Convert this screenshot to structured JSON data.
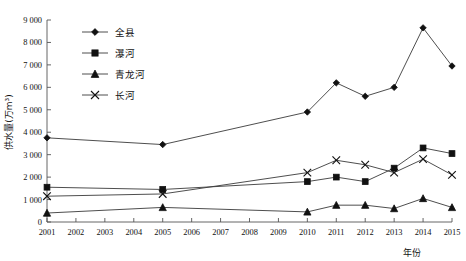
{
  "chart_data": {
    "type": "line",
    "title": "",
    "xlabel": "年份",
    "ylabel": "供水量(万m³)",
    "x": [
      2001,
      2005,
      2010,
      2011,
      2012,
      2013,
      2014,
      2015
    ],
    "categories": [
      "2001",
      "2002",
      "2003",
      "2004",
      "2005",
      "2006",
      "2007",
      "2008",
      "2009",
      "2010",
      "2011",
      "2012",
      "2013",
      "2014",
      "2015"
    ],
    "xlim": [
      2001,
      2015
    ],
    "ylim": [
      0,
      9000
    ],
    "yticks": [
      0,
      1000,
      2000,
      3000,
      4000,
      5000,
      6000,
      7000,
      8000,
      9000
    ],
    "ytick_labels": [
      "0",
      "1 000",
      "2 000",
      "3 000",
      "4 000",
      "5 000",
      "6 000",
      "7 000",
      "8 000",
      "9 000"
    ],
    "grid": false,
    "legend_position": "upper-left",
    "series": [
      {
        "name": "全县",
        "marker": "diamond",
        "x": [
          2001,
          2005,
          2010,
          2011,
          2012,
          2013,
          2014,
          2015
        ],
        "values": [
          3750,
          3450,
          4900,
          6200,
          5600,
          6000,
          8650,
          6950
        ]
      },
      {
        "name": "瀑河",
        "marker": "square",
        "x": [
          2001,
          2005,
          2010,
          2011,
          2012,
          2013,
          2014,
          2015
        ],
        "values": [
          1550,
          1450,
          1800,
          2000,
          1800,
          2400,
          3300,
          3050
        ]
      },
      {
        "name": "青龙河",
        "marker": "triangle",
        "x": [
          2001,
          2005,
          2010,
          2011,
          2012,
          2013,
          2014,
          2015
        ],
        "values": [
          400,
          650,
          450,
          750,
          750,
          600,
          1050,
          650
        ]
      },
      {
        "name": "长河",
        "marker": "cross",
        "x": [
          2001,
          2005,
          2010,
          2011,
          2012,
          2013,
          2014,
          2015
        ],
        "values": [
          1150,
          1250,
          2200,
          2750,
          2550,
          2200,
          2800,
          2100
        ]
      }
    ]
  },
  "legend": {
    "items": [
      {
        "label": "全县",
        "marker": "diamond"
      },
      {
        "label": "瀑河",
        "marker": "square"
      },
      {
        "label": "青龙河",
        "marker": "triangle"
      },
      {
        "label": "长河",
        "marker": "cross"
      }
    ]
  },
  "axes": {
    "y_title": "供水量(万m³)",
    "x_title": "年份"
  }
}
